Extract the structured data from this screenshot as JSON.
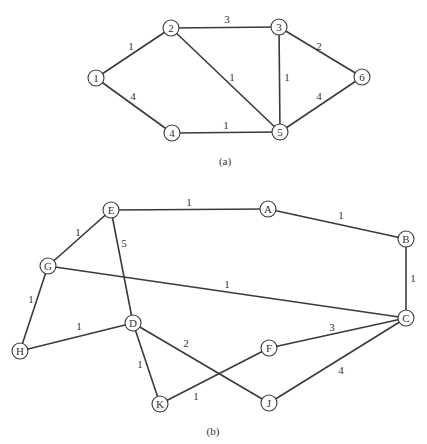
{
  "graphs": [
    {
      "id": "a",
      "caption": "(a)",
      "caption_pos": [
        225,
        165
      ],
      "nodes": [
        {
          "id": "1",
          "label": "1",
          "x": 96,
          "y": 78
        },
        {
          "id": "2",
          "label": "2",
          "x": 171,
          "y": 28
        },
        {
          "id": "3",
          "label": "3",
          "x": 279,
          "y": 27
        },
        {
          "id": "4",
          "label": "4",
          "x": 172,
          "y": 133
        },
        {
          "id": "5",
          "label": "5",
          "x": 280,
          "y": 132
        },
        {
          "id": "6",
          "label": "6",
          "x": 362,
          "y": 77
        }
      ],
      "edges": [
        {
          "from": "1",
          "to": "2",
          "weight": "1",
          "lx": 131,
          "ly": 50
        },
        {
          "from": "1",
          "to": "4",
          "weight": "4",
          "lx": 133,
          "ly": 100
        },
        {
          "from": "2",
          "to": "3",
          "weight": "3",
          "lx": 227,
          "ly": 23
        },
        {
          "from": "2",
          "to": "5",
          "weight": "1",
          "lx": 232,
          "ly": 81
        },
        {
          "from": "3",
          "to": "5",
          "weight": "1",
          "lx": 287,
          "ly": 81
        },
        {
          "from": "3",
          "to": "6",
          "weight": "2",
          "lx": 319,
          "ly": 50
        },
        {
          "from": "4",
          "to": "5",
          "weight": "1",
          "lx": 226,
          "ly": 129
        },
        {
          "from": "5",
          "to": "6",
          "weight": "4",
          "lx": 319,
          "ly": 100
        }
      ]
    },
    {
      "id": "b",
      "caption": "(b)",
      "caption_pos": [
        213,
        435
      ],
      "nodes": [
        {
          "id": "E",
          "label": "E",
          "x": 111,
          "y": 210
        },
        {
          "id": "A",
          "label": "A",
          "x": 268,
          "y": 209
        },
        {
          "id": "B",
          "label": "B",
          "x": 406,
          "y": 239
        },
        {
          "id": "G",
          "label": "G",
          "x": 48,
          "y": 266
        },
        {
          "id": "C",
          "label": "C",
          "x": 406,
          "y": 318
        },
        {
          "id": "D",
          "label": "D",
          "x": 133,
          "y": 323
        },
        {
          "id": "H",
          "label": "H",
          "x": 20,
          "y": 351
        },
        {
          "id": "F",
          "label": "F",
          "x": 269,
          "y": 348
        },
        {
          "id": "K",
          "label": "K",
          "x": 160,
          "y": 404
        },
        {
          "id": "J",
          "label": "J",
          "x": 269,
          "y": 403
        }
      ],
      "edges": [
        {
          "from": "E",
          "to": "A",
          "weight": "1",
          "lx": 189,
          "ly": 206
        },
        {
          "from": "A",
          "to": "B",
          "weight": "1",
          "lx": 341,
          "ly": 219
        },
        {
          "from": "B",
          "to": "C",
          "weight": "1",
          "lx": 413,
          "ly": 282
        },
        {
          "from": "E",
          "to": "G",
          "weight": "1",
          "lx": 78,
          "ly": 236
        },
        {
          "from": "E",
          "to": "D",
          "weight": "5",
          "lx": 124,
          "ly": 247
        },
        {
          "from": "G",
          "to": "C",
          "weight": "1",
          "lx": 227,
          "ly": 288
        },
        {
          "from": "G",
          "to": "H",
          "weight": "1",
          "lx": 31,
          "ly": 303
        },
        {
          "from": "H",
          "to": "D",
          "weight": "1",
          "lx": 79,
          "ly": 330
        },
        {
          "from": "D",
          "to": "J",
          "weight": "2",
          "lx": 186,
          "ly": 347
        },
        {
          "from": "D",
          "to": "K",
          "weight": "1",
          "lx": 140,
          "ly": 368
        },
        {
          "from": "K",
          "to": "F",
          "weight": "1",
          "lx": 196,
          "ly": 400
        },
        {
          "from": "F",
          "to": "C",
          "weight": "3",
          "lx": 332,
          "ly": 331
        },
        {
          "from": "J",
          "to": "C",
          "weight": "4",
          "lx": 341,
          "ly": 374
        }
      ]
    }
  ],
  "style": {
    "node_radius": 8,
    "stroke_color": "#3a3a3a",
    "text_color": "#333333",
    "background": "#ffffff"
  }
}
